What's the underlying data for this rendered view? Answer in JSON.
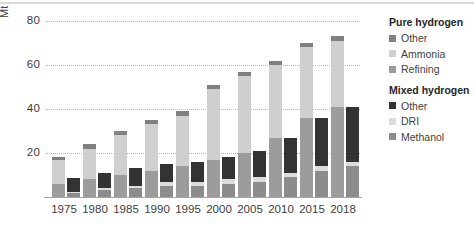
{
  "chart_data": {
    "type": "bar",
    "title": "",
    "subtitle": "",
    "xlabel": "",
    "ylabel": "Mt",
    "unit": "Mt",
    "ylim": [
      0,
      80
    ],
    "yticks": [
      20,
      40,
      60,
      80
    ],
    "ytick_labels": [
      "20",
      "40",
      "60",
      "80"
    ],
    "grid": true,
    "grid_style": "dotted horizontal",
    "legend_position": "right",
    "group_mode": "grouped-stacked",
    "categories": [
      "1975",
      "1980",
      "1985",
      "1990",
      "1995",
      "2000",
      "2005",
      "2010",
      "2015",
      "2018"
    ],
    "groups": [
      {
        "name": "Pure hydrogen",
        "series": [
          {
            "name": "Refining",
            "color": "#9c9c9c",
            "values": [
              6,
              8,
              10,
              12,
              14,
              17,
              20,
              27,
              36,
              41
            ]
          },
          {
            "name": "Ammonia",
            "color": "#cfcfcf",
            "values": [
              11,
              14,
              18,
              21,
              23,
              32,
              35,
              33,
              32,
              30
            ]
          },
          {
            "name": "Other",
            "color": "#808080",
            "values": [
              1,
              2,
              2,
              2,
              2,
              2,
              2,
              2,
              2,
              2
            ]
          }
        ],
        "totals": [
          18,
          24,
          30,
          35,
          39,
          51,
          57,
          62,
          70,
          73
        ]
      },
      {
        "name": "Mixed hydrogen",
        "series": [
          {
            "name": "Methanol",
            "color": "#8c8c8c",
            "values": [
              2,
              3,
              4,
              5,
              5,
              6,
              7,
              9,
              12,
              14
            ]
          },
          {
            "name": "DRI",
            "color": "#dcdcdc",
            "values": [
              0.5,
              1,
              1,
              2,
              2,
              2,
              2,
              2,
              2,
              2
            ]
          },
          {
            "name": "Other",
            "color": "#333333",
            "values": [
              6,
              7,
              8,
              8,
              9,
              10,
              12,
              16,
              22,
              25
            ]
          }
        ],
        "totals": [
          8.5,
          11,
          13,
          15,
          16,
          18,
          21,
          27,
          36,
          41
        ]
      }
    ]
  },
  "legend": {
    "sections": [
      {
        "heading": "Pure hydrogen",
        "items": [
          {
            "label": "Other",
            "color": "#808080"
          },
          {
            "label": "Ammonia",
            "color": "#cfcfcf"
          },
          {
            "label": "Refining",
            "color": "#9c9c9c"
          }
        ]
      },
      {
        "heading": "Mixed hydrogen",
        "items": [
          {
            "label": "Other",
            "color": "#333333"
          },
          {
            "label": "DRI",
            "color": "#dcdcdc"
          },
          {
            "label": "Methanol",
            "color": "#8c8c8c"
          }
        ]
      }
    ]
  },
  "colors": {
    "gridline": "#b9b9b9",
    "axis": "#a6a6a6",
    "text": "#404040",
    "heading_text": "#262626",
    "background": "#ffffff",
    "top_rule": "#d9d9d9"
  }
}
